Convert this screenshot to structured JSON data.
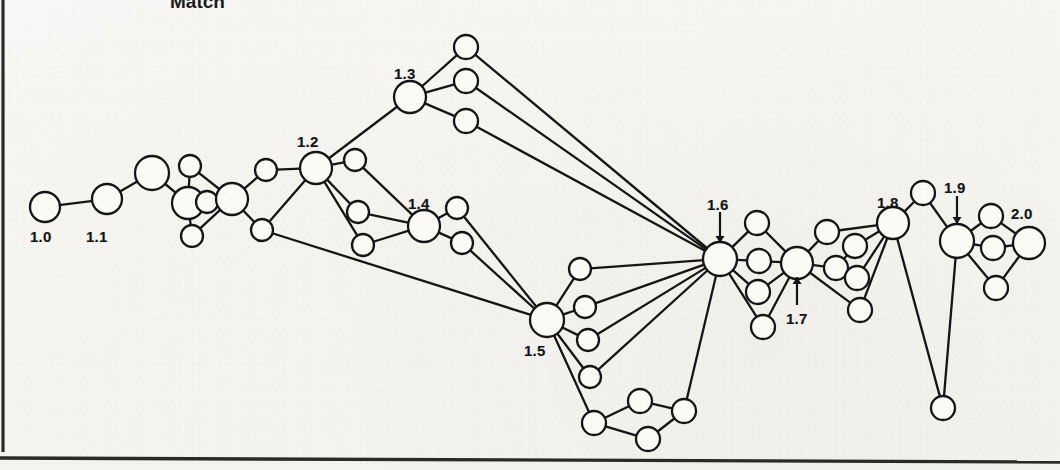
{
  "page": {
    "title_fragment": "Match",
    "bg_color": "#f6f5f1",
    "ink_color": "#151515",
    "node_fill": "#fbfaf7"
  },
  "rules": {
    "left_margin_rule": "vertical-rule-left",
    "bottom_rule": "horizontal-rule-bottom"
  },
  "diagram": {
    "type": "node-link-graph",
    "labels": [
      {
        "id": "1.0",
        "text": "1.0",
        "x": 30,
        "y": 228,
        "anchor": "node-1-0",
        "arrow": false
      },
      {
        "id": "1.1",
        "text": "1.1",
        "x": 86,
        "y": 228,
        "anchor": "node-1-1",
        "arrow": false
      },
      {
        "id": "1.2",
        "text": "1.2",
        "x": 297,
        "y": 133,
        "anchor": "node-1-2",
        "arrow": false
      },
      {
        "id": "1.3",
        "text": "1.3",
        "x": 394,
        "y": 65,
        "anchor": "node-1-3",
        "arrow": false
      },
      {
        "id": "1.4",
        "text": "1.4",
        "x": 408,
        "y": 195,
        "anchor": "node-1-4",
        "arrow": false
      },
      {
        "id": "1.5",
        "text": "1.5",
        "x": 524,
        "y": 342,
        "anchor": "node-1-5",
        "arrow": false
      },
      {
        "id": "1.6",
        "text": "1.6",
        "x": 707,
        "y": 196,
        "anchor": "node-1-6",
        "arrow": true
      },
      {
        "id": "1.7",
        "text": "1.7",
        "x": 786,
        "y": 310,
        "anchor": "node-1-7",
        "arrow": true
      },
      {
        "id": "1.8",
        "text": "1.8",
        "x": 877,
        "y": 194,
        "anchor": "node-1-8",
        "arrow": false
      },
      {
        "id": "1.9",
        "text": "1.9",
        "x": 944,
        "y": 179,
        "anchor": "node-1-9",
        "arrow": true
      },
      {
        "id": "2.0",
        "text": "2.0",
        "x": 1011,
        "y": 205,
        "anchor": "node-2-0",
        "arrow": false
      }
    ],
    "arrows": [
      {
        "for": "1.6",
        "x1": 720,
        "y1": 212,
        "x2": 720,
        "y2": 243
      },
      {
        "for": "1.7",
        "x1": 797,
        "y1": 305,
        "x2": 797,
        "y2": 277
      },
      {
        "for": "1.9",
        "x1": 957,
        "y1": 196,
        "x2": 957,
        "y2": 224
      }
    ],
    "nodes": [
      {
        "id": "n1",
        "name": "node-1-0",
        "x": 45,
        "y": 207,
        "r": 15
      },
      {
        "id": "n2",
        "name": "node-1-1",
        "x": 107,
        "y": 199,
        "r": 15
      },
      {
        "id": "n3",
        "name": "node-a",
        "x": 152,
        "y": 173,
        "r": 17
      },
      {
        "id": "n4",
        "name": "node-b",
        "x": 188,
        "y": 203,
        "r": 16
      },
      {
        "id": "n5",
        "name": "node-c",
        "x": 190,
        "y": 166,
        "r": 11
      },
      {
        "id": "n6",
        "name": "node-d",
        "x": 207,
        "y": 202,
        "r": 11
      },
      {
        "id": "n7",
        "name": "node-e",
        "x": 192,
        "y": 236,
        "r": 11
      },
      {
        "id": "n8",
        "name": "node-f",
        "x": 232,
        "y": 199,
        "r": 16
      },
      {
        "id": "n9",
        "name": "node-g",
        "x": 266,
        "y": 170,
        "r": 11
      },
      {
        "id": "n10",
        "name": "node-h",
        "x": 262,
        "y": 230,
        "r": 11
      },
      {
        "id": "n11",
        "name": "node-1-2",
        "x": 316,
        "y": 168,
        "r": 16
      },
      {
        "id": "n12",
        "name": "node-i",
        "x": 355,
        "y": 160,
        "r": 11
      },
      {
        "id": "n13",
        "name": "node-j",
        "x": 358,
        "y": 212,
        "r": 11
      },
      {
        "id": "n14",
        "name": "node-k",
        "x": 363,
        "y": 245,
        "r": 11
      },
      {
        "id": "n15",
        "name": "node-1-3",
        "x": 410,
        "y": 97,
        "r": 16
      },
      {
        "id": "n16",
        "name": "node-l",
        "x": 466,
        "y": 47,
        "r": 12
      },
      {
        "id": "n17",
        "name": "node-m",
        "x": 466,
        "y": 81,
        "r": 12
      },
      {
        "id": "n18",
        "name": "node-n",
        "x": 466,
        "y": 121,
        "r": 12
      },
      {
        "id": "n19",
        "name": "node-1-4",
        "x": 424,
        "y": 226,
        "r": 16
      },
      {
        "id": "n20",
        "name": "node-o",
        "x": 457,
        "y": 208,
        "r": 11
      },
      {
        "id": "n21",
        "name": "node-p",
        "x": 462,
        "y": 243,
        "r": 11
      },
      {
        "id": "n22",
        "name": "node-1-5",
        "x": 547,
        "y": 320,
        "r": 17
      },
      {
        "id": "n23",
        "name": "node-q",
        "x": 580,
        "y": 269,
        "r": 11
      },
      {
        "id": "n24",
        "name": "node-r",
        "x": 585,
        "y": 307,
        "r": 11
      },
      {
        "id": "n25",
        "name": "node-s",
        "x": 588,
        "y": 340,
        "r": 11
      },
      {
        "id": "n26",
        "name": "node-t",
        "x": 590,
        "y": 377,
        "r": 11
      },
      {
        "id": "n27",
        "name": "node-u",
        "x": 594,
        "y": 423,
        "r": 12
      },
      {
        "id": "n28",
        "name": "node-v",
        "x": 640,
        "y": 401,
        "r": 12
      },
      {
        "id": "n29",
        "name": "node-w",
        "x": 648,
        "y": 439,
        "r": 12
      },
      {
        "id": "n30",
        "name": "node-x",
        "x": 684,
        "y": 411,
        "r": 12
      },
      {
        "id": "n31",
        "name": "node-1-6",
        "x": 720,
        "y": 259,
        "r": 17
      },
      {
        "id": "n32",
        "name": "node-y",
        "x": 757,
        "y": 223,
        "r": 12
      },
      {
        "id": "n33",
        "name": "node-z",
        "x": 759,
        "y": 261,
        "r": 12
      },
      {
        "id": "n34",
        "name": "node-aa",
        "x": 758,
        "y": 292,
        "r": 12
      },
      {
        "id": "n35",
        "name": "node-ab",
        "x": 763,
        "y": 327,
        "r": 12
      },
      {
        "id": "n36",
        "name": "node-1-7",
        "x": 797,
        "y": 263,
        "r": 16
      },
      {
        "id": "n37",
        "name": "node-ac",
        "x": 827,
        "y": 232,
        "r": 12
      },
      {
        "id": "n38",
        "name": "node-ad",
        "x": 836,
        "y": 268,
        "r": 12
      },
      {
        "id": "n39",
        "name": "node-ae",
        "x": 855,
        "y": 246,
        "r": 12
      },
      {
        "id": "n40",
        "name": "node-af",
        "x": 857,
        "y": 278,
        "r": 12
      },
      {
        "id": "n41",
        "name": "node-ag",
        "x": 860,
        "y": 310,
        "r": 12
      },
      {
        "id": "n42",
        "name": "node-1-8",
        "x": 893,
        "y": 223,
        "r": 16
      },
      {
        "id": "n43",
        "name": "node-ah",
        "x": 923,
        "y": 193,
        "r": 12
      },
      {
        "id": "n44",
        "name": "node-1-9",
        "x": 957,
        "y": 241,
        "r": 17
      },
      {
        "id": "n45",
        "name": "node-ai",
        "x": 991,
        "y": 216,
        "r": 12
      },
      {
        "id": "n46",
        "name": "node-aj",
        "x": 993,
        "y": 248,
        "r": 12
      },
      {
        "id": "n47",
        "name": "node-ak",
        "x": 996,
        "y": 288,
        "r": 12
      },
      {
        "id": "n48",
        "name": "node-2-0",
        "x": 1029,
        "y": 243,
        "r": 16
      },
      {
        "id": "n49",
        "name": "node-al",
        "x": 943,
        "y": 408,
        "r": 12
      }
    ],
    "edges": [
      [
        "n1",
        "n2"
      ],
      [
        "n2",
        "n3"
      ],
      [
        "n3",
        "n4"
      ],
      [
        "n4",
        "n5"
      ],
      [
        "n4",
        "n7"
      ],
      [
        "n4",
        "n6"
      ],
      [
        "n5",
        "n8"
      ],
      [
        "n6",
        "n8"
      ],
      [
        "n7",
        "n8"
      ],
      [
        "n8",
        "n9"
      ],
      [
        "n8",
        "n10"
      ],
      [
        "n9",
        "n11"
      ],
      [
        "n10",
        "n11"
      ],
      [
        "n11",
        "n12"
      ],
      [
        "n11",
        "n13"
      ],
      [
        "n11",
        "n14"
      ],
      [
        "n11",
        "n15"
      ],
      [
        "n12",
        "n19"
      ],
      [
        "n13",
        "n19"
      ],
      [
        "n14",
        "n19"
      ],
      [
        "n15",
        "n16"
      ],
      [
        "n15",
        "n17"
      ],
      [
        "n15",
        "n18"
      ],
      [
        "n16",
        "n31"
      ],
      [
        "n17",
        "n31"
      ],
      [
        "n18",
        "n31"
      ],
      [
        "n19",
        "n20"
      ],
      [
        "n19",
        "n21"
      ],
      [
        "n20",
        "n22"
      ],
      [
        "n21",
        "n22"
      ],
      [
        "n10",
        "n22"
      ],
      [
        "n22",
        "n23"
      ],
      [
        "n22",
        "n24"
      ],
      [
        "n22",
        "n25"
      ],
      [
        "n22",
        "n26"
      ],
      [
        "n22",
        "n27"
      ],
      [
        "n23",
        "n31"
      ],
      [
        "n24",
        "n31"
      ],
      [
        "n25",
        "n31"
      ],
      [
        "n26",
        "n31"
      ],
      [
        "n27",
        "n28"
      ],
      [
        "n27",
        "n29"
      ],
      [
        "n28",
        "n30"
      ],
      [
        "n29",
        "n30"
      ],
      [
        "n30",
        "n31"
      ],
      [
        "n31",
        "n32"
      ],
      [
        "n31",
        "n33"
      ],
      [
        "n31",
        "n34"
      ],
      [
        "n31",
        "n35"
      ],
      [
        "n32",
        "n36"
      ],
      [
        "n33",
        "n36"
      ],
      [
        "n34",
        "n36"
      ],
      [
        "n35",
        "n36"
      ],
      [
        "n36",
        "n37"
      ],
      [
        "n36",
        "n38"
      ],
      [
        "n36",
        "n41"
      ],
      [
        "n37",
        "n42"
      ],
      [
        "n38",
        "n39"
      ],
      [
        "n39",
        "n42"
      ],
      [
        "n40",
        "n42"
      ],
      [
        "n38",
        "n40"
      ],
      [
        "n41",
        "n42"
      ],
      [
        "n42",
        "n43"
      ],
      [
        "n43",
        "n44"
      ],
      [
        "n44",
        "n45"
      ],
      [
        "n44",
        "n46"
      ],
      [
        "n44",
        "n47"
      ],
      [
        "n45",
        "n48"
      ],
      [
        "n46",
        "n48"
      ],
      [
        "n47",
        "n48"
      ],
      [
        "n42",
        "n49"
      ],
      [
        "n44",
        "n49"
      ]
    ]
  }
}
